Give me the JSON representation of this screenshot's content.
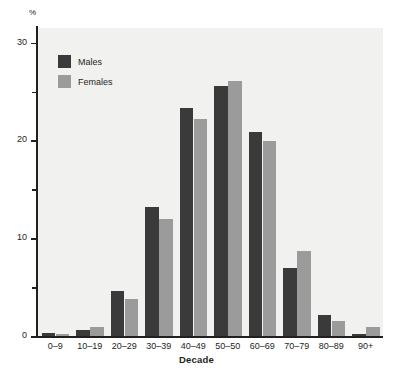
{
  "chart_data": {
    "type": "bar",
    "title": "",
    "xlabel": "Decade",
    "ylabel": "%",
    "unit_label": "%",
    "categories": [
      "0–9",
      "10–19",
      "20–29",
      "30–39",
      "40–49",
      "50–50",
      "60–69",
      "70–79",
      "80–89",
      "90+"
    ],
    "series": [
      {
        "name": "Males",
        "color": "#3a3a3a",
        "values": [
          0.3,
          0.6,
          4.6,
          13.2,
          23.3,
          25.6,
          20.9,
          7.0,
          2.1,
          0.2
        ]
      },
      {
        "name": "Females",
        "color": "#9b9b9b",
        "values": [
          0.2,
          0.9,
          3.8,
          12.0,
          22.2,
          26.1,
          19.9,
          8.7,
          1.5,
          0.9
        ]
      }
    ],
    "ylim": [
      0,
      31.5
    ],
    "y_major_ticks": [
      0,
      10,
      20,
      30
    ],
    "y_minor_ticks": [
      5,
      15,
      25
    ],
    "y_tick_labels": [
      "0",
      "10",
      "20",
      "30"
    ],
    "grid": false,
    "legend_position": "top-left",
    "plot_background": "#f1f1f0",
    "axis_color": "#231f20"
  },
  "legend": {
    "items": [
      {
        "label": "Males",
        "swatch": "male"
      },
      {
        "label": "Females",
        "swatch": "female"
      }
    ]
  },
  "axes": {
    "unit": "%",
    "x_title": "Decade"
  }
}
